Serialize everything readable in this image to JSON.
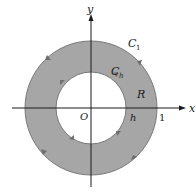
{
  "figure": {
    "colors": {
      "region_fill": "#a6a6a6",
      "axis": "#1a1a1a",
      "circle_stroke": "#7a7a7a",
      "background": "#ffffff"
    },
    "axes": {
      "x_label": "x",
      "y_label": "y",
      "origin_label": "O"
    },
    "curves": {
      "outer": {
        "label_main": "C",
        "label_sub": "1",
        "radius_label": "1"
      },
      "inner": {
        "label_main": "C",
        "label_sub": "h",
        "radius_label": "h"
      }
    },
    "region_label": "R"
  }
}
